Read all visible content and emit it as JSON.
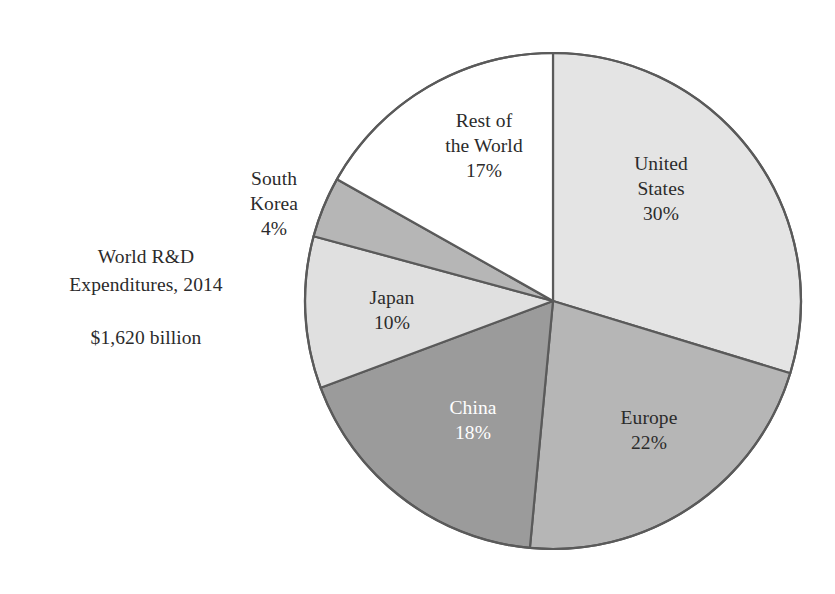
{
  "caption": {
    "line1": "World R&D",
    "line2": "Expenditures, 2014",
    "amount": "$1,620 billion"
  },
  "chart_data": {
    "type": "pie",
    "title": "World R&D Expenditures, 2014",
    "subtitle": "$1,620 billion",
    "total_label": "$1,620 billion",
    "total_value": 1620,
    "units": "billion USD",
    "year": 2014,
    "legend": "none",
    "labels_inside_slices": true,
    "start_angle_deg": 0,
    "direction": "clockwise",
    "categories": [
      "United States",
      "Europe",
      "China",
      "Japan",
      "South Korea",
      "Rest of the World"
    ],
    "values": [
      30,
      22,
      18,
      10,
      4,
      17
    ],
    "slices": [
      {
        "name": "United States",
        "label_line1": "United",
        "label_line2": "States",
        "percent": 30,
        "percent_label": "30%",
        "fill": "#e4e4e4",
        "text_color": "#2b2b2b",
        "label_placement": "inside"
      },
      {
        "name": "Europe",
        "label_line1": "Europe",
        "label_line2": "",
        "percent": 22,
        "percent_label": "22%",
        "fill": "#b6b6b6",
        "text_color": "#2b2b2b",
        "label_placement": "inside"
      },
      {
        "name": "China",
        "label_line1": "China",
        "label_line2": "",
        "percent": 18,
        "percent_label": "18%",
        "fill": "#9b9b9b",
        "text_color": "#ffffff",
        "label_placement": "inside"
      },
      {
        "name": "Japan",
        "label_line1": "Japan",
        "label_line2": "",
        "percent": 10,
        "percent_label": "10%",
        "fill": "#e0e0e0",
        "text_color": "#2b2b2b",
        "label_placement": "inside"
      },
      {
        "name": "South Korea",
        "label_line1": "South",
        "label_line2": "Korea",
        "percent": 4,
        "percent_label": "4%",
        "fill": "#b6b6b6",
        "text_color": "#2b2b2b",
        "label_placement": "outside-left"
      },
      {
        "name": "Rest of the World",
        "label_line1": "Rest of",
        "label_line2": "the World",
        "percent": 17,
        "percent_label": "17%",
        "fill": "#ffffff",
        "text_color": "#2b2b2b",
        "label_placement": "inside"
      }
    ],
    "geometry": {
      "center_x": 553,
      "center_y": 301,
      "radius": 248
    },
    "style": {
      "background": "#ffffff",
      "stroke": "#5a5a5a",
      "stroke_width": 2.2
    }
  }
}
